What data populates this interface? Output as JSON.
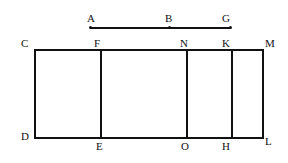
{
  "figure": {
    "type": "geometry-diagram",
    "background_color": "#ffffff",
    "stroke_color": "#111111",
    "label_color": "#111111",
    "stroke_width_px": 2,
    "segment": {
      "name": "segment-AG",
      "y_px": 27,
      "x_start_px": 90,
      "x_end_px": 230,
      "points": [
        {
          "label": "A",
          "x_px": 90,
          "marker": "dot",
          "label_x_px": 87,
          "label_y_px": 13
        },
        {
          "label": "B",
          "x_px": 169,
          "marker": "dot",
          "label_x_px": 165,
          "label_y_px": 13
        },
        {
          "label": "G",
          "x_px": 230,
          "marker": "dot",
          "label_x_px": 222,
          "label_y_px": 13
        }
      ]
    },
    "rectangle": {
      "name": "rectangle-CDLM",
      "left_px": 34,
      "right_px": 262,
      "top_px": 49,
      "bottom_px": 137,
      "corners": [
        {
          "label": "C",
          "position": "top-left",
          "label_x_px": 21,
          "label_y_px": 38
        },
        {
          "label": "M",
          "position": "top-right",
          "label_x_px": 265,
          "label_y_px": 38
        },
        {
          "label": "D",
          "position": "bottom-left",
          "label_x_px": 21,
          "label_y_px": 131
        },
        {
          "label": "L",
          "position": "bottom-right",
          "label_x_px": 265,
          "label_y_px": 136
        }
      ],
      "dividers": [
        {
          "name": "divider-FE",
          "x_px": 100,
          "top_label": "F",
          "top_label_x_px": 94,
          "top_label_y_px": 38,
          "bottom_label": "E",
          "bottom_label_x_px": 96,
          "bottom_label_y_px": 141
        },
        {
          "name": "divider-NO",
          "x_px": 186,
          "top_label": "N",
          "top_label_x_px": 180,
          "top_label_y_px": 38,
          "bottom_label": "O",
          "bottom_label_x_px": 181,
          "bottom_label_y_px": 141
        },
        {
          "name": "divider-KH",
          "x_px": 231,
          "top_label": "K",
          "top_label_x_px": 222,
          "top_label_y_px": 38,
          "bottom_label": "H",
          "bottom_label_x_px": 222,
          "bottom_label_y_px": 141
        }
      ]
    }
  }
}
